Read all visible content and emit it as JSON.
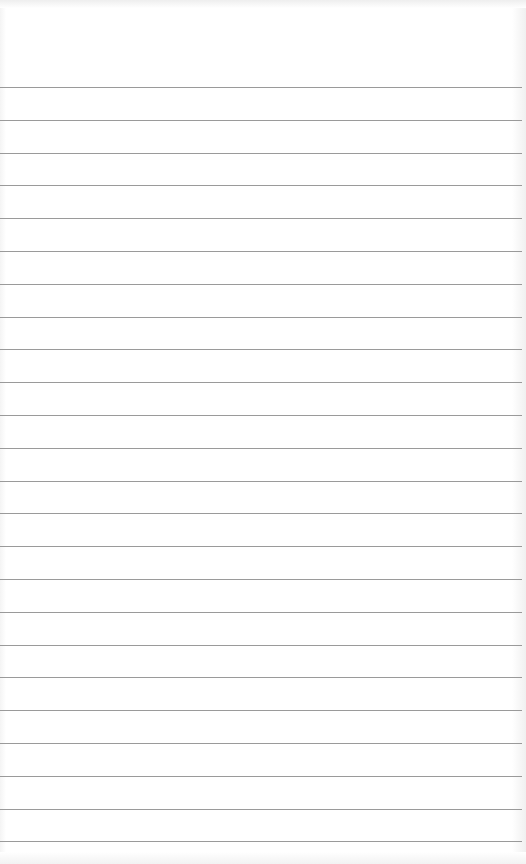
{
  "page": {
    "type": "lined-notepad-page",
    "background_color": "#ffffff",
    "rule_color": "#9a9a9a",
    "rule_count": 24,
    "first_rule_y": 87,
    "rule_spacing": 32.8,
    "text_lines": []
  }
}
